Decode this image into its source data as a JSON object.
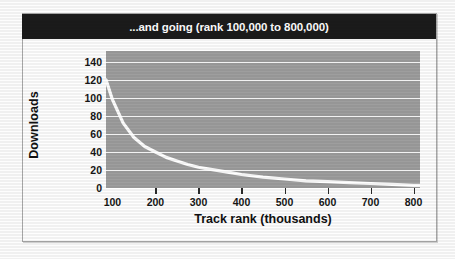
{
  "chart_data": {
    "type": "line",
    "title": "...and going (rank 100,000 to 800,000)",
    "xlabel": "Track rank (thousands)",
    "ylabel": "Downloads",
    "xlim": [
      85,
      815
    ],
    "ylim": [
      0,
      152
    ],
    "xticks": [
      100,
      200,
      300,
      400,
      500,
      600,
      700,
      800
    ],
    "yticks": [
      0,
      20,
      40,
      60,
      80,
      100,
      120,
      140
    ],
    "grid": true,
    "legend": "none",
    "series": [
      {
        "name": "Downloads",
        "color": "#ffffff",
        "x": [
          85,
          100,
          125,
          150,
          175,
          200,
          225,
          250,
          275,
          300,
          325,
          350,
          375,
          400,
          450,
          500,
          550,
          600,
          650,
          700,
          750,
          800,
          815
        ],
        "values": [
          120,
          98,
          72,
          56,
          46,
          40,
          34,
          30,
          26,
          23,
          21,
          19,
          17,
          15,
          12,
          10,
          8,
          7,
          6,
          5,
          4,
          3,
          3
        ]
      }
    ],
    "plot_bg_color": "#9e9e9e",
    "gridline_color": "#f2f2f2",
    "title_bar_color": "#1b1b1b",
    "title_text_color": "#ffffff"
  }
}
